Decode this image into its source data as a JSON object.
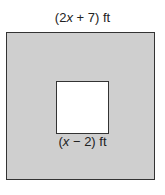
{
  "diagram": {
    "outer_square": {
      "label_pre": "(2",
      "label_var": "x",
      "label_post": " + 7) ft",
      "fill": "#cfcfcf"
    },
    "inner_square": {
      "label_pre": "(",
      "label_var": "x",
      "label_post": " − 2) ft",
      "fill": "#ffffff"
    }
  }
}
